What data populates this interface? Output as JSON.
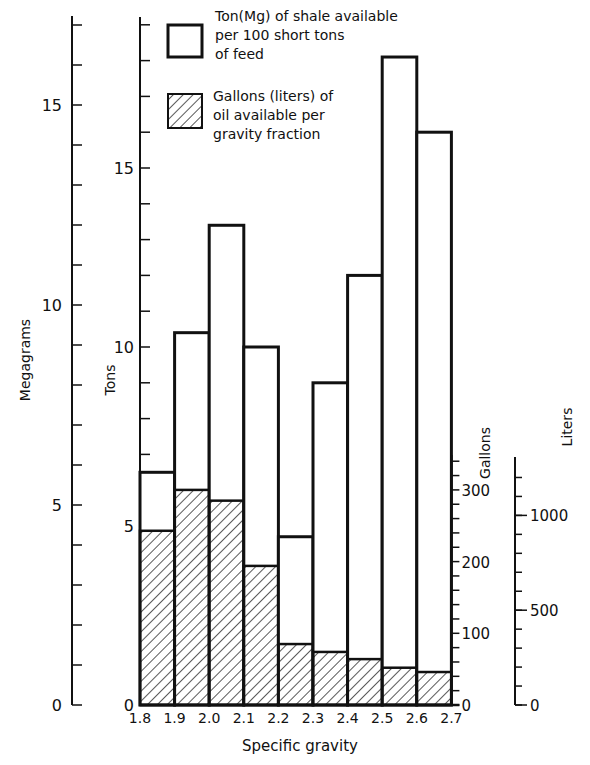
{
  "chart_data": {
    "type": "bar",
    "title": "",
    "xlabel": "Specific gravity",
    "x_ticks": [
      "1.8",
      "1.9",
      "2.0",
      "2.1",
      "2.2",
      "2.3",
      "2.4",
      "2.5",
      "2.6",
      "2.7"
    ],
    "categories": [
      "1.8-1.9",
      "1.9-2.0",
      "2.0-2.1",
      "2.1-2.2",
      "2.2-2.3",
      "2.3-2.4",
      "2.4-2.5",
      "2.5-2.6",
      "2.6-2.7"
    ],
    "series": [
      {
        "name": "Ton(Mg) of shale available per 100 short tons of feed",
        "style": "open",
        "axis": "Tons",
        "values": [
          6.5,
          10.4,
          13.4,
          10.0,
          4.7,
          9.0,
          12.0,
          18.1,
          16.0
        ]
      },
      {
        "name": "Gallons (liters) of oil available per gravity fraction",
        "style": "hatched",
        "axis": "Gallons",
        "values": [
          243,
          300,
          285,
          194,
          85,
          74,
          64,
          52,
          46
        ]
      }
    ],
    "axes": {
      "megagrams": {
        "label": "Megagrams",
        "ticks": [
          "0",
          "5",
          "10",
          "15"
        ],
        "range": [
          0,
          17.5
        ]
      },
      "tons": {
        "label": "Tons",
        "ticks": [
          "0",
          "5",
          "10",
          "15"
        ],
        "range": [
          0,
          19
        ]
      },
      "gallons": {
        "label": "Gallons",
        "ticks": [
          "0",
          "100",
          "200",
          "300"
        ],
        "range": [
          0,
          335
        ]
      },
      "liters": {
        "label": "Liters",
        "ticks": [
          "0",
          "500",
          "1000"
        ],
        "range": [
          0,
          1250
        ]
      }
    },
    "grid": false,
    "legend_position": "top-center"
  },
  "legend": {
    "open_label_lines": [
      "Ton(Mg) of shale available",
      "per 100 short tons",
      "of feed"
    ],
    "hatched_label_lines": [
      "Gallons (liters) of",
      "oil available per",
      "gravity fraction"
    ]
  }
}
